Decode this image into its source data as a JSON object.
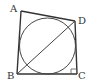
{
  "diagram": {
    "type": "geometry",
    "stroke_color": "#333333",
    "background": "#ffffff",
    "vertices": {
      "A": {
        "label": "A",
        "x": 21,
        "y": 11
      },
      "B": {
        "label": "B",
        "x": 17,
        "y": 74
      },
      "C": {
        "label": "C",
        "x": 77,
        "y": 74
      },
      "D": {
        "label": "D",
        "x": 75,
        "y": 21
      }
    },
    "circle": {
      "cx": 47.5,
      "cy": 46,
      "r": 28
    },
    "segments": [
      "AB",
      "BC",
      "CD",
      "DA",
      "BD"
    ],
    "right_angle_at": "C",
    "labels": {
      "A": "A",
      "B": "B",
      "C": "C",
      "D": "D"
    }
  }
}
